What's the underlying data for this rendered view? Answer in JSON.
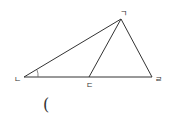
{
  "diagram": {
    "type": "triangle",
    "colors": {
      "stroke": "#333333",
      "background": "#ffffff"
    },
    "points": {
      "apex": {
        "label": "ㄱ",
        "x": 121,
        "y": 19,
        "lx": 123,
        "ly": 16
      },
      "left": {
        "label": "ㄴ",
        "x": 24,
        "y": 77,
        "lx": 17,
        "ly": 82
      },
      "base_point": {
        "label": "ㄷ",
        "x": 89,
        "y": 77,
        "lx": 89,
        "ly": 88
      },
      "right": {
        "label": "ㄹ",
        "x": 152,
        "y": 77,
        "lx": 158,
        "ly": 82
      }
    },
    "segments": [
      "ㄱㄴ",
      "ㄱㄷ",
      "ㄱㄹ",
      "ㄴㄹ"
    ],
    "angle_mark": {
      "at": "ㄴ"
    },
    "answer_blank": {
      "text": "("
    }
  }
}
